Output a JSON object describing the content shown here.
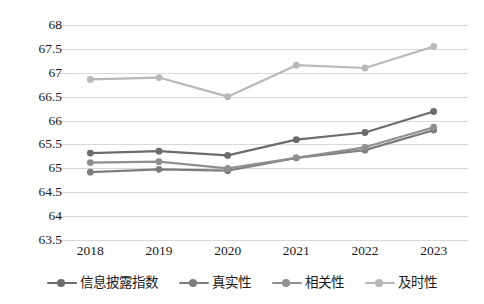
{
  "chart_data": {
    "type": "line",
    "title": "",
    "xlabel": "",
    "ylabel": "",
    "categories": [
      "2018",
      "2019",
      "2020",
      "2021",
      "2022",
      "2023"
    ],
    "ylim": [
      63.5,
      68
    ],
    "ytick_step": 0.5,
    "yticks": [
      "68",
      "67.5",
      "67",
      "66.5",
      "66",
      "65.5",
      "65",
      "64.5",
      "64",
      "63.5"
    ],
    "grid": true,
    "legend_position": "bottom",
    "series": [
      {
        "name": "信息披露指数",
        "color": "#6b6b6b",
        "values": [
          65.32,
          65.36,
          65.27,
          65.6,
          65.75,
          66.19
        ]
      },
      {
        "name": "真实性",
        "color": "#7d7d7d",
        "values": [
          64.92,
          64.98,
          64.95,
          65.22,
          65.38,
          65.8
        ]
      },
      {
        "name": "相关性",
        "color": "#8f8f8f",
        "values": [
          65.12,
          65.14,
          65.0,
          65.22,
          65.44,
          65.86
        ]
      },
      {
        "name": "及时性",
        "color": "#b8b8b8",
        "values": [
          66.86,
          66.9,
          66.5,
          67.16,
          67.1,
          67.55
        ]
      }
    ]
  }
}
